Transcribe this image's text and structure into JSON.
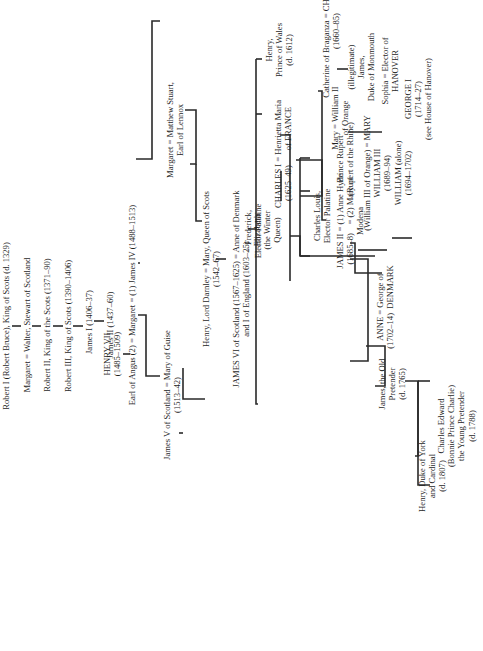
{
  "diagram": {
    "type": "family-tree",
    "orientation": "rotated-90-ccw",
    "line_color": "#2a2a2a",
    "text_color": "#1f1f1f"
  },
  "nodes": {
    "robert_i": {
      "lines": [
        "Robert I (Robert Bruce), King of Scots (d. 1329)"
      ]
    },
    "margaret_walter": {
      "lines": [
        "Margaret = Walter, Stewart of Scotland"
      ]
    },
    "robert_ii": {
      "lines": [
        "Robert II, King of the Scots (1371–90)"
      ]
    },
    "robert_iii": {
      "lines": [
        "Robert III, King of Scots (1390–1406)"
      ]
    },
    "james_i": {
      "lines": [
        "James I (1406–37)"
      ]
    },
    "james_ii_scot": {
      "lines": [
        "James II (1437–60)"
      ]
    },
    "henry_vii": {
      "lines": [
        "HENRY VII",
        "(1485–1509)"
      ]
    },
    "margaret_marriages": {
      "lines": [
        "Earl of Angus  (2)  = Margaret = (1)  James IV (1488–1513)"
      ]
    },
    "james_v": {
      "lines": [
        "James V of Scotland = Mary of Guise",
        "(1513–42)"
      ]
    },
    "margaret_stuart": {
      "lines": [
        "Margaret = Matthew Stuart,",
        "Earl of Lennox"
      ]
    },
    "darnley_mary": {
      "lines": [
        "Henry, Lord Darnley = Mary, Queen of Scots",
        "(1542–67)"
      ]
    },
    "james_vi": {
      "lines": [
        "JAMES VI of Scotland (1567–1625) = Anne of Denmark",
        "and I of England (1603–25)"
      ]
    },
    "henry_prince_wales": {
      "lines": [
        "Henry,",
        "Prince of Wales",
        "(d. 1612)"
      ]
    },
    "charles_i": {
      "lines": [
        "CHARLES I = Henrietta Maria",
        "(1625–49)       of FRANCE"
      ]
    },
    "elizabeth": {
      "lines": [
        "Elizabeth",
        "(the Winter",
        "Queen)"
      ]
    },
    "frederick": {
      "lines": [
        "= Frederick,",
        "Elector Palatine"
      ]
    },
    "charles_ii": {
      "lines": [
        "Catherine of Braganza = CHARLES II",
        "(1660–85)"
      ]
    },
    "monmouth": {
      "lines": [
        "(illegitimate)",
        "James,",
        "Duke of Monmouth"
      ]
    },
    "mary_william_ii": {
      "lines": [
        "Mary = William II",
        "of Orange"
      ]
    },
    "james_ii": {
      "lines": [
        "JAMES II = (1) Anne Hyde",
        "(1685–8)    = (2) Mary of",
        "Modena"
      ]
    },
    "william_mary": {
      "lines": [
        "(William III of Orange) = MARY",
        "WILLIAM III",
        "(1689–94)",
        "WILLIAM (alone)",
        "(1694–1702)"
      ]
    },
    "anne": {
      "lines": [
        "ANNE = George of",
        "(1702–14)  DENMARK"
      ]
    },
    "old_pretender": {
      "lines": [
        "James, the Old",
        "Pretender",
        "(d. 1765)"
      ]
    },
    "charles_louis": {
      "lines": [
        "Charles Louis,",
        "Elector Palatine"
      ]
    },
    "prince_rupert": {
      "lines": [
        "Prince Rupert",
        "(Rupert of the Rhine)"
      ]
    },
    "sophia": {
      "lines": [
        "Sophia = Elector of",
        "HANOVER"
      ]
    },
    "george_i": {
      "lines": [
        "GEORGE I",
        "(1714–27)",
        "(see House of Hanover)"
      ]
    },
    "charles_edward": {
      "lines": [
        "Charles Edward",
        "(Bonnie Prince Charlie)",
        "the Young Pretender",
        "(d. 1788)"
      ]
    },
    "henry_york": {
      "lines": [
        "Henry, Duke of York",
        "and Cardinal",
        "(d. 1807)"
      ]
    }
  }
}
